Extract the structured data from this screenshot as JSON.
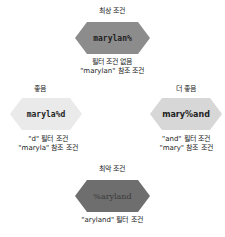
{
  "nodes": {
    "best": {
      "title": "최상 조건",
      "pattern": "marylan%",
      "fill": "#8c8c8c",
      "text_color": "#222222",
      "captions": [
        "필터 조건 없음",
        "\"marylan\" 참조 조건"
      ]
    },
    "good": {
      "title": "좋음",
      "pattern": "maryla%d",
      "fill": "#eaeaea",
      "text_color": "#222222",
      "captions": [
        "\"d\" 필터 조건",
        "\"maryla\" 참조 조건"
      ]
    },
    "better": {
      "title": "더 좋음",
      "pattern": "mary%and",
      "fill": "#d7d7d7",
      "text_color": "#222222",
      "captions": [
        "\"and\" 필터 조건",
        "\"mary\" 참조 조건"
      ]
    },
    "worst": {
      "title": "최악 조건",
      "pattern": "%aryland",
      "fill": "#6e6e6e",
      "text_color": "#3a3a3a",
      "captions": [
        "\"aryland\" 필터 조건"
      ]
    }
  }
}
